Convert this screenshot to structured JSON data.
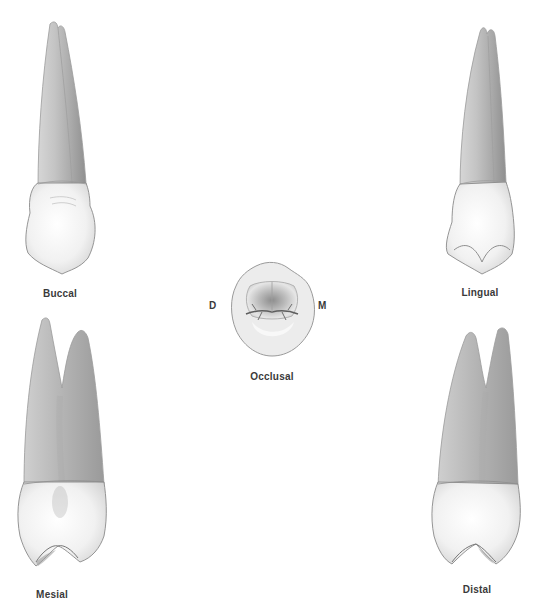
{
  "figure": {
    "views": {
      "buccal": {
        "label": "Buccal"
      },
      "lingual": {
        "label": "Lingual"
      },
      "occlusal": {
        "label": "Occlusal",
        "left_marker": "D",
        "right_marker": "M"
      },
      "mesial": {
        "label": "Mesial"
      },
      "distal": {
        "label": "Distal"
      }
    },
    "colors": {
      "background": "#ffffff",
      "label_text": "#3a3a3a",
      "root_shade": "#b5b5b5",
      "crown_highlight": "#fafafa",
      "outline": "#8a8a8a"
    }
  }
}
